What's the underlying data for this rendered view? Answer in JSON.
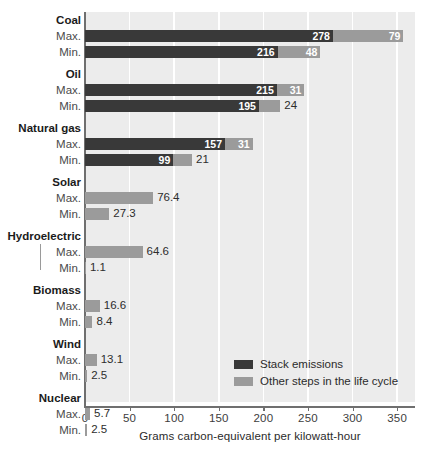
{
  "chart_data": {
    "type": "bar",
    "orientation": "horizontal",
    "stacked": true,
    "title": "",
    "xlabel": "Grams carbon-equivalent per kilowatt-hour",
    "ylabel": "",
    "xlim": [
      0,
      370
    ],
    "xticks": [
      0,
      50,
      100,
      150,
      200,
      250,
      300,
      350
    ],
    "xticklabels": [
      "0",
      "50",
      "100",
      "150",
      "200",
      "250",
      "300",
      "350"
    ],
    "grid": "vertical-white",
    "legend_position": "inside-lower-right",
    "series": [
      {
        "name": "Stack emissions",
        "color": "#393939"
      },
      {
        "name": "Other steps in the life cycle",
        "color": "#9b9b9b"
      }
    ],
    "groups": [
      {
        "name": "Coal",
        "rows": [
          {
            "label": "Max.",
            "stack": 278,
            "other": 79,
            "stack_text": "278",
            "other_text": "79"
          },
          {
            "label": "Min.",
            "stack": 216,
            "other": 48,
            "stack_text": "216",
            "other_text": "48"
          }
        ]
      },
      {
        "name": "Oil",
        "rows": [
          {
            "label": "Max.",
            "stack": 215,
            "other": 31,
            "stack_text": "215",
            "other_text": "31"
          },
          {
            "label": "Min.",
            "stack": 195,
            "other": 24,
            "stack_text": "195",
            "other_text": "24"
          }
        ]
      },
      {
        "name": "Natural gas",
        "rows": [
          {
            "label": "Max.",
            "stack": 157,
            "other": 31,
            "stack_text": "157",
            "other_text": "31"
          },
          {
            "label": "Min.",
            "stack": 99,
            "other": 21,
            "stack_text": "99",
            "other_text": "21"
          }
        ]
      },
      {
        "name": "Solar",
        "rows": [
          {
            "label": "Max.",
            "stack": 0,
            "other": 76.4,
            "stack_text": "",
            "other_text": "76.4"
          },
          {
            "label": "Min.",
            "stack": 0,
            "other": 27.3,
            "stack_text": "",
            "other_text": "27.3"
          }
        ]
      },
      {
        "name": "Hydroelectric",
        "rows": [
          {
            "label": "Max.",
            "stack": 0,
            "other": 64.6,
            "stack_text": "",
            "other_text": "64.6"
          },
          {
            "label": "Min.",
            "stack": 0,
            "other": 1.1,
            "stack_text": "",
            "other_text": "1.1"
          }
        ]
      },
      {
        "name": "Biomass",
        "rows": [
          {
            "label": "Max.",
            "stack": 0,
            "other": 16.6,
            "stack_text": "",
            "other_text": "16.6"
          },
          {
            "label": "Min.",
            "stack": 0,
            "other": 8.4,
            "stack_text": "",
            "other_text": "8.4"
          }
        ]
      },
      {
        "name": "Wind",
        "rows": [
          {
            "label": "Max.",
            "stack": 0,
            "other": 13.1,
            "stack_text": "",
            "other_text": "13.1"
          },
          {
            "label": "Min.",
            "stack": 0,
            "other": 2.5,
            "stack_text": "",
            "other_text": "2.5"
          }
        ]
      },
      {
        "name": "Nuclear",
        "rows": [
          {
            "label": "Max.",
            "stack": 0,
            "other": 5.7,
            "stack_text": "",
            "other_text": "5.7"
          },
          {
            "label": "Min.",
            "stack": 0,
            "other": 2.5,
            "stack_text": "",
            "other_text": "2.5"
          }
        ]
      }
    ]
  },
  "colors": {
    "stack": "#393939",
    "other": "#9b9b9b",
    "plot_background": "#ececec",
    "gridline": "#ffffff",
    "axis": "#6f6f6f",
    "page_background": "#ffffff"
  }
}
